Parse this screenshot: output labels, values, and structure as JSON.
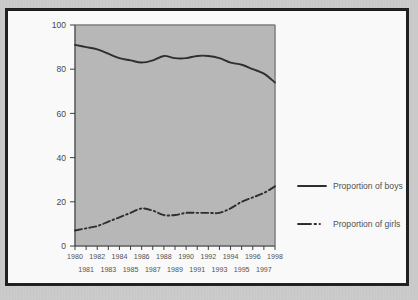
{
  "figure": {
    "plot_background": "#b7b7b7",
    "frame_color": "#1c1c1c",
    "page_background": "#cdcdcd"
  },
  "chart_data": {
    "type": "line",
    "title": "",
    "xlabel": "",
    "ylabel": "",
    "ylim": [
      0,
      100
    ],
    "xlim": [
      1980,
      1998
    ],
    "grid": false,
    "legend_position": "right",
    "yticks": [
      "0",
      "20",
      "40",
      "60",
      "80",
      "100"
    ],
    "ytick_values": [
      0,
      20,
      40,
      60,
      80,
      100
    ],
    "x": [
      1980,
      1981,
      1982,
      1983,
      1984,
      1985,
      1986,
      1987,
      1988,
      1989,
      1990,
      1991,
      1992,
      1993,
      1994,
      1995,
      1996,
      1997,
      1998
    ],
    "xticks_top": [
      "1980",
      "1982",
      "1984",
      "1986",
      "1988",
      "1990",
      "1992",
      "1994",
      "1996",
      "1998"
    ],
    "xticks_bottom": [
      "1981",
      "1983",
      "1985",
      "1987",
      "1989",
      "1991",
      "1993",
      "1995",
      "1997"
    ],
    "series": [
      {
        "name": "Proportion of boys",
        "style": "solid",
        "color": "#2b2b2b",
        "values": [
          91,
          90,
          89,
          87,
          85,
          84,
          83,
          84,
          86,
          85,
          85,
          86,
          86,
          85,
          83,
          82,
          80,
          78,
          74
        ]
      },
      {
        "name": "Proportion of girls",
        "style": "dash-dot",
        "color": "#2b2b2b",
        "values": [
          7,
          8,
          9,
          11,
          13,
          15,
          17,
          16,
          14,
          14,
          15,
          15,
          15,
          15,
          17,
          20,
          22,
          24,
          27
        ]
      }
    ]
  },
  "legend": {
    "items": [
      {
        "label": "Proportion of boys",
        "style": "solid"
      },
      {
        "label": "Proportion of girls",
        "style": "dash-dot"
      }
    ]
  }
}
